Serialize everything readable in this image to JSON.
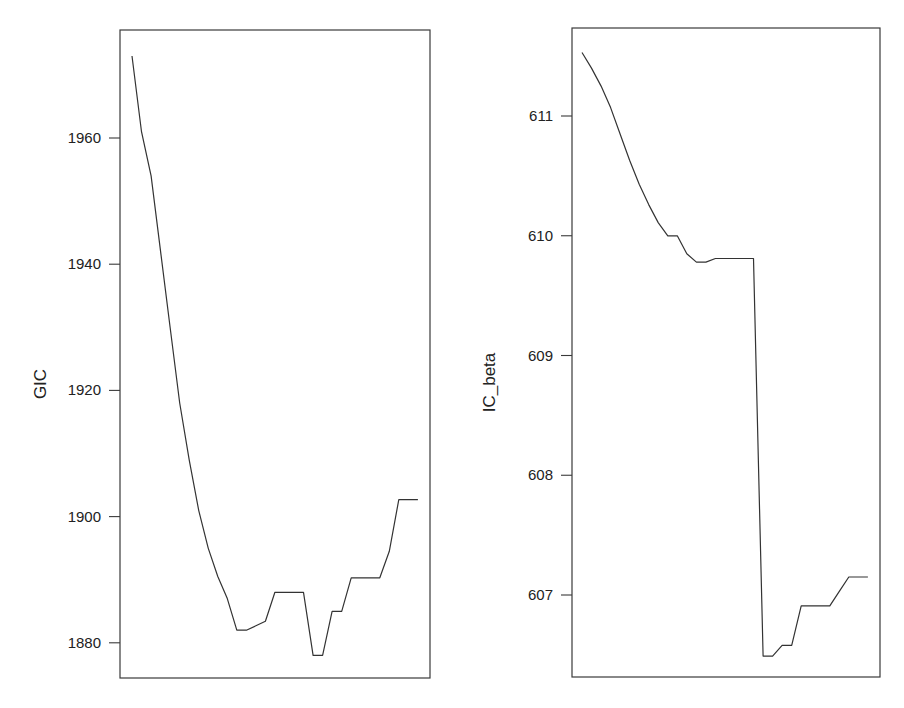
{
  "chart_data": [
    {
      "type": "line",
      "title": "",
      "xlabel": "",
      "ylabel": "GIC",
      "x": [
        0,
        1,
        2,
        3,
        4,
        5,
        6,
        7,
        8,
        9,
        10,
        11,
        12,
        13,
        14,
        15,
        16,
        17,
        18,
        19,
        20,
        21,
        22,
        23,
        24,
        25,
        26,
        27,
        28,
        29,
        30
      ],
      "series": [
        {
          "name": "GIC",
          "values": [
            1973,
            1961,
            1954,
            1942,
            1930,
            1918,
            1909,
            1901,
            1895,
            1890.5,
            1887,
            1882,
            1882,
            1882.7,
            1883.4,
            1888,
            1888,
            1888,
            1888,
            1878,
            1878,
            1885,
            1885,
            1890.3,
            1890.3,
            1890.3,
            1890.3,
            1894.5,
            1902.7,
            1902.7,
            1902.7
          ]
        }
      ],
      "yticks": [
        1880,
        1900,
        1920,
        1940,
        1960
      ],
      "ytick_labels": [
        "1880",
        "1900",
        "1920",
        "1940",
        "1960"
      ],
      "xticks": [],
      "ylim": [
        1874.1,
        1976.3
      ],
      "grid": false,
      "legend": null,
      "layout": {
        "box": {
          "left": 120,
          "top": 30,
          "right": 430,
          "bottom": 678
        },
        "y_ref_value": 1960,
        "y_ref_px": 138,
        "px_per_unit": 6.31,
        "x_start_px": 132,
        "x_step_px": 9.53,
        "label_x": 40
      }
    },
    {
      "type": "line",
      "title": "",
      "xlabel": "",
      "ylabel": "IC_beta",
      "x": [
        0,
        1,
        2,
        3,
        4,
        5,
        6,
        7,
        8,
        9,
        10,
        11,
        12,
        13,
        14,
        15,
        16,
        17,
        18,
        19,
        20,
        21,
        22,
        23,
        24,
        25,
        26,
        27,
        28,
        29,
        30
      ],
      "series": [
        {
          "name": "IC_beta",
          "values": [
            611.53,
            611.4,
            611.25,
            611.07,
            610.85,
            610.63,
            610.43,
            610.26,
            610.11,
            610.0,
            610.0,
            609.85,
            609.78,
            609.78,
            609.81,
            609.81,
            609.81,
            609.81,
            609.81,
            606.49,
            606.49,
            606.58,
            606.58,
            606.91,
            606.91,
            606.91,
            606.91,
            607.03,
            607.15,
            607.15,
            607.15
          ]
        }
      ],
      "yticks": [
        607,
        608,
        609,
        610,
        611
      ],
      "ytick_labels": [
        "607",
        "608",
        "609",
        "610",
        "611"
      ],
      "xticks": [],
      "ylim": [
        606.32,
        611.73
      ],
      "grid": false,
      "legend": null,
      "layout": {
        "box": {
          "left": 572,
          "top": 28,
          "right": 880,
          "bottom": 677
        },
        "y_ref_value": 611,
        "y_ref_px": 116,
        "px_per_unit": 119.75,
        "x_start_px": 582,
        "x_step_px": 9.53,
        "label_x": 489
      }
    }
  ]
}
